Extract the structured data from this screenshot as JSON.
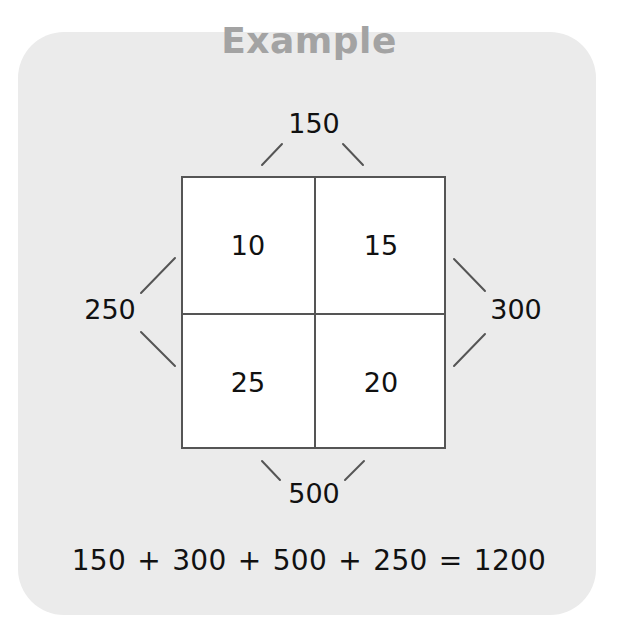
{
  "title": "Example",
  "grid": {
    "cells": [
      {
        "position": "top-left",
        "value": "10"
      },
      {
        "position": "top-right",
        "value": "15"
      },
      {
        "position": "bottom-left",
        "value": "25"
      },
      {
        "position": "bottom-right",
        "value": "20"
      }
    ]
  },
  "sums": {
    "top": "150",
    "right": "300",
    "bottom": "500",
    "left": "250"
  },
  "equation": "150 + 300 + 500 + 250 = 1200",
  "colors": {
    "panel_bg": "#ebebeb",
    "title": "#a3a3a3",
    "grid_line": "#555555",
    "text": "#111111"
  }
}
